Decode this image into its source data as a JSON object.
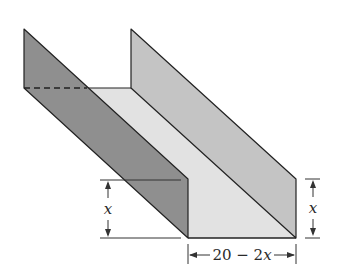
{
  "figure": {
    "type": "gutter-trough-diagram",
    "colors": {
      "left_side": "#8f8f8f",
      "right_side": "#c4c4c4",
      "base": "#e2e2e2",
      "edge": "#222222",
      "background": "#ffffff"
    }
  },
  "labels": {
    "left_height": "x",
    "right_height": "x",
    "base_width_num": "20 − 2",
    "base_width_var": "x"
  }
}
